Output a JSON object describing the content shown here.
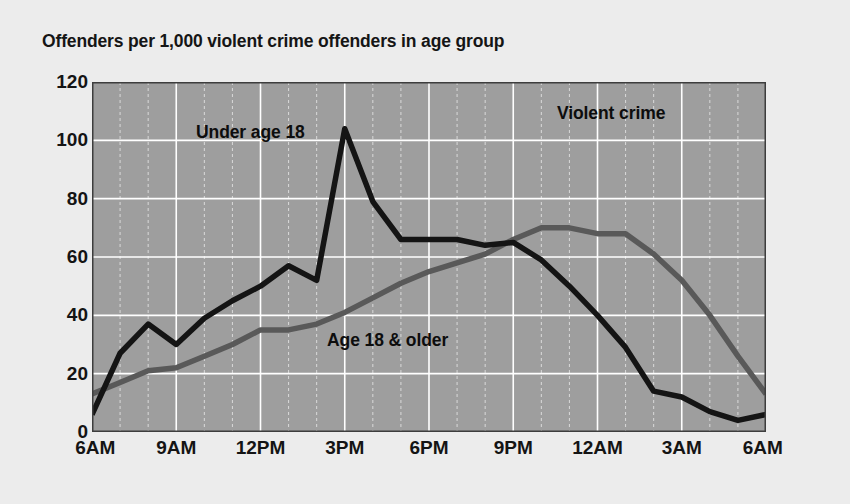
{
  "chart_data": {
    "type": "line",
    "title": "Offenders per 1,000 violent crime offenders in age group",
    "subtitle": "",
    "xlabel": "",
    "ylabel": "",
    "annotation": "Violent crime",
    "xlim": [
      0,
      24
    ],
    "ylim": [
      0,
      120
    ],
    "yticks": [
      0,
      20,
      40,
      60,
      80,
      100,
      120
    ],
    "ytick_labels": [
      "0",
      "20",
      "40",
      "60",
      "80",
      "100",
      "120"
    ],
    "xticks": [
      0,
      3,
      6,
      9,
      12,
      15,
      18,
      21,
      24
    ],
    "xtick_labels": [
      "6AM",
      "9AM",
      "12PM",
      "3PM",
      "6PM",
      "9PM",
      "12AM",
      "3AM",
      "6AM"
    ],
    "grid": true,
    "grid_color": "#ffffff",
    "minor_grid": true,
    "plot_background": "#9e9e9e",
    "figure_background": "#ececec",
    "legend_position": "inline-annotations",
    "x": [
      0,
      1,
      2,
      3,
      4,
      5,
      6,
      7,
      8,
      9,
      10,
      11,
      12,
      13,
      14,
      15,
      16,
      17,
      18,
      19,
      20,
      21,
      22,
      23,
      24
    ],
    "hour_labels": [
      "6AM",
      "7AM",
      "8AM",
      "9AM",
      "10AM",
      "11AM",
      "12PM",
      "1PM",
      "2PM",
      "3PM",
      "4PM",
      "5PM",
      "6PM",
      "7PM",
      "8PM",
      "9PM",
      "10PM",
      "11PM",
      "12AM",
      "1AM",
      "2AM",
      "3AM",
      "4AM",
      "5AM",
      "6AM"
    ],
    "series": [
      {
        "name": "Under age 18",
        "color": "#141414",
        "label_text": "Under age 18",
        "values": [
          6,
          27,
          37,
          30,
          39,
          45,
          50,
          57,
          52,
          104,
          79,
          66,
          66,
          66,
          64,
          65,
          59,
          50,
          40,
          29,
          14,
          12,
          7,
          4,
          6
        ]
      },
      {
        "name": "Age 18 & older",
        "color": "#595959",
        "label_text": "Age 18 & older",
        "values": [
          13,
          17,
          21,
          22,
          26,
          30,
          35,
          35,
          37,
          41,
          46,
          51,
          55,
          58,
          61,
          66,
          70,
          70,
          68,
          68,
          61,
          52,
          40,
          26,
          13
        ]
      }
    ]
  }
}
